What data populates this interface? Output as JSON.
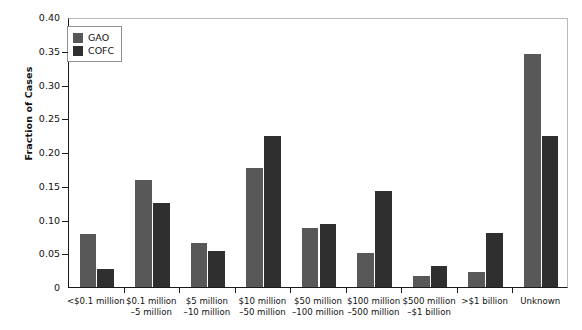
{
  "chart_data": {
    "type": "bar",
    "title": "",
    "xlabel": "",
    "ylabel": "Fraction of Cases",
    "ylim": [
      0,
      0.4
    ],
    "yticks": [
      "0",
      "0.05",
      "0.10",
      "0.15",
      "0.20",
      "0.25",
      "0.30",
      "0.35",
      "0.40"
    ],
    "ytick_values": [
      0,
      0.05,
      0.1,
      0.15,
      0.2,
      0.25,
      0.3,
      0.35,
      0.4
    ],
    "grid": false,
    "legend_position": "upper-left-inside",
    "categories": [
      {
        "line1": "<$0.1 million",
        "line2": ""
      },
      {
        "line1": "$0.1 million",
        "line2": "–5 million"
      },
      {
        "line1": "$5 million",
        "line2": "–10 million"
      },
      {
        "line1": "$10 million",
        "line2": "–50 million"
      },
      {
        "line1": "$50 million",
        "line2": "–100 million"
      },
      {
        "line1": "$100 million",
        "line2": "–500 million"
      },
      {
        "line1": "$500 million",
        "line2": "–$1 billion"
      },
      {
        "line1": ">$1 billion",
        "line2": ""
      },
      {
        "line1": "Unknown",
        "line2": ""
      }
    ],
    "series": [
      {
        "name": "GAO",
        "color": "#585858",
        "values": [
          0.079,
          0.159,
          0.065,
          0.177,
          0.088,
          0.051,
          0.017,
          0.022,
          0.345
        ]
      },
      {
        "name": "COFC",
        "color": "#2f2f2f",
        "values": [
          0.026,
          0.125,
          0.053,
          0.224,
          0.094,
          0.142,
          0.031,
          0.08,
          0.224
        ]
      }
    ]
  }
}
